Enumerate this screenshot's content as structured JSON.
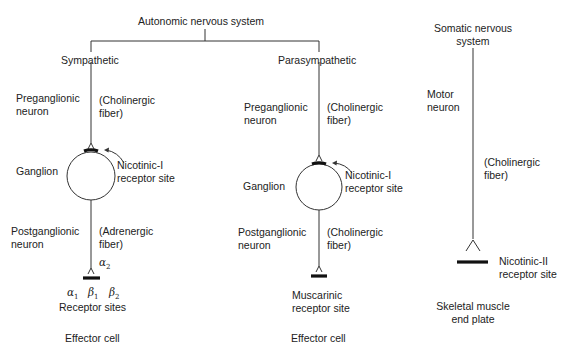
{
  "diagram": {
    "autonomic": {
      "title": "Autonomic nervous system",
      "sympathetic": {
        "title": "Sympathetic",
        "preganglionic_label": "Preganglionic\nneuron",
        "preganglionic_line1": "Preganglionic",
        "preganglionic_line2": "neuron",
        "pre_fiber_line1": "(Cholinergic",
        "pre_fiber_line2": "fiber)",
        "ganglion": "Ganglion",
        "nicotinic_line1": "Nicotinic-I",
        "nicotinic_line2": "receptor site",
        "postganglionic_line1": "Postganglionic",
        "postganglionic_line2": "neuron",
        "post_fiber_line1": "(Adrenergic",
        "post_fiber_line2": "fiber)",
        "receptors": {
          "alpha2": "α",
          "alpha2_sub": "2",
          "alpha1": "α",
          "alpha1_sub": "1",
          "beta1": "β",
          "beta1_sub": "1",
          "beta2": "β",
          "beta2_sub": "2"
        },
        "receptor_sites": "Receptor sites",
        "effector": "Effector cell"
      },
      "parasympathetic": {
        "title": "Parasympathetic",
        "preganglionic_line1": "Preganglionic",
        "preganglionic_line2": "neuron",
        "pre_fiber_line1": "(Cholinergic",
        "pre_fiber_line2": "fiber)",
        "ganglion": "Ganglion",
        "nicotinic_line1": "Nicotinic-I",
        "nicotinic_line2": "receptor site",
        "postganglionic_line1": "Postganglionic",
        "postganglionic_line2": "neuron",
        "post_fiber_line1": "(Cholinergic",
        "post_fiber_line2": "fiber)",
        "muscarinic_line1": "Muscarinic",
        "muscarinic_line2": "receptor site",
        "effector": "Effector cell"
      }
    },
    "somatic": {
      "title_line1": "Somatic nervous",
      "title_line2": "system",
      "motor_line1": "Motor",
      "motor_line2": "neuron",
      "fiber_line1": "(Cholinergic",
      "fiber_line2": "fiber)",
      "nicotinic_line1": "Nicotinic-II",
      "nicotinic_line2": "receptor site",
      "endplate_line1": "Skeletal muscle",
      "endplate_line2": "end plate"
    },
    "colors": {
      "line": "#333333",
      "text": "#222222",
      "background": "#ffffff"
    }
  }
}
